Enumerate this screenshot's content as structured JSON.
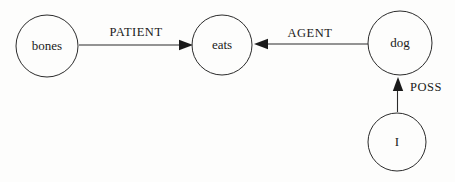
{
  "diagram": {
    "type": "semantic-network",
    "nodes": {
      "bones": {
        "label": "bones"
      },
      "eats": {
        "label": "eats"
      },
      "dog": {
        "label": "dog"
      },
      "i": {
        "label": "I"
      }
    },
    "edges": {
      "patient": {
        "label": "PATIENT",
        "from": "bones",
        "to": "eats"
      },
      "agent": {
        "label": "AGENT",
        "from": "dog",
        "to": "eats"
      },
      "poss": {
        "label": "POSS",
        "from": "i",
        "to": "dog"
      }
    },
    "colors": {
      "line": "#2b2b2b",
      "text": "#1a1a1a",
      "background": "#fdfdfc"
    }
  }
}
